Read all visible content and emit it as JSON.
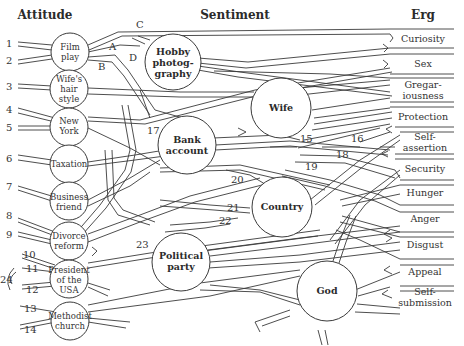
{
  "headers": {
    "attitude": "Attitude",
    "sentiment": "Sentiment",
    "erg": "Erg"
  },
  "attitudes": [
    {
      "id": "film-play",
      "lines": [
        "Film",
        "play"
      ],
      "numbers": [
        "1",
        "2"
      ]
    },
    {
      "id": "wifes-hair-style",
      "lines": [
        "Wife's",
        "hair",
        "style"
      ],
      "numbers": [
        "3"
      ]
    },
    {
      "id": "new-york",
      "lines": [
        "New",
        "York"
      ],
      "numbers": [
        "4",
        "5"
      ]
    },
    {
      "id": "taxation",
      "lines": [
        "Taxation"
      ],
      "numbers": [
        "6"
      ]
    },
    {
      "id": "business-friend",
      "lines": [
        "Business",
        "friend"
      ],
      "numbers": [
        "7"
      ]
    },
    {
      "id": "divorce-reform",
      "lines": [
        "Divorce",
        "reform"
      ],
      "numbers": [
        "8",
        "9"
      ]
    },
    {
      "id": "president-of-the-usa",
      "lines": [
        "President",
        "of the",
        "USA"
      ],
      "numbers": [
        "10",
        "11",
        "12"
      ]
    },
    {
      "id": "methodist-church",
      "lines": [
        "Methodist",
        "church"
      ],
      "numbers": [
        "13",
        "14"
      ]
    }
  ],
  "bracket_label": "24",
  "sentiments": [
    {
      "id": "hobby-photography",
      "lines": [
        "Hobby",
        "photog-",
        "graphy"
      ]
    },
    {
      "id": "wife",
      "lines": [
        "Wife"
      ]
    },
    {
      "id": "bank-account",
      "lines": [
        "Bank",
        "account"
      ]
    },
    {
      "id": "country",
      "lines": [
        "Country"
      ]
    },
    {
      "id": "political-party",
      "lines": [
        "Political",
        "party"
      ]
    },
    {
      "id": "god",
      "lines": [
        "God"
      ]
    }
  ],
  "ergs": [
    {
      "id": "curiosity",
      "lines": [
        "Curiosity"
      ]
    },
    {
      "id": "sex",
      "lines": [
        "Sex"
      ]
    },
    {
      "id": "gregariousness",
      "lines": [
        "Gregar-",
        "iousness"
      ]
    },
    {
      "id": "protection",
      "lines": [
        "Protection"
      ]
    },
    {
      "id": "self-assertion",
      "lines": [
        "Self-",
        "assertion"
      ]
    },
    {
      "id": "security",
      "lines": [
        "Security"
      ]
    },
    {
      "id": "hunger",
      "lines": [
        "Hunger"
      ]
    },
    {
      "id": "anger",
      "lines": [
        "Anger"
      ]
    },
    {
      "id": "disgust",
      "lines": [
        "Disgust"
      ]
    },
    {
      "id": "appeal",
      "lines": [
        "Appeal"
      ]
    },
    {
      "id": "self-submission",
      "lines": [
        "Self-",
        "submission"
      ]
    }
  ],
  "path_labels": {
    "A": "A",
    "B": "B",
    "C": "C",
    "D": "D",
    "n15": "15",
    "n16": "16",
    "n17": "17",
    "n18": "18",
    "n19": "19",
    "n20": "20",
    "n21": "21",
    "n22": "22",
    "n23": "23"
  }
}
